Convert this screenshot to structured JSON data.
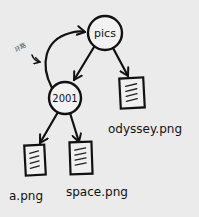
{
  "diagram": {
    "type": "directory-tree",
    "style": "hand-drawn",
    "background_color": "#ebebeb",
    "nodes": [
      {
        "id": "pics",
        "label": "pics",
        "kind": "directory"
      },
      {
        "id": "2001",
        "label": "2001",
        "kind": "directory"
      },
      {
        "id": "odyssey",
        "label": "odyssey.png",
        "kind": "file"
      },
      {
        "id": "a",
        "label": "a.png",
        "kind": "file"
      },
      {
        "id": "space",
        "label": "space.png",
        "kind": "file"
      }
    ],
    "edges": [
      {
        "from": "pics",
        "to": "2001"
      },
      {
        "from": "pics",
        "to": "odyssey.png"
      },
      {
        "from": "2001",
        "to": "a.png"
      },
      {
        "from": "2001",
        "to": "space.png"
      },
      {
        "from": "2001",
        "to": "pics",
        "kind": "loop"
      }
    ],
    "annotation": {
      "text": "环路",
      "points_to": "loop"
    }
  }
}
